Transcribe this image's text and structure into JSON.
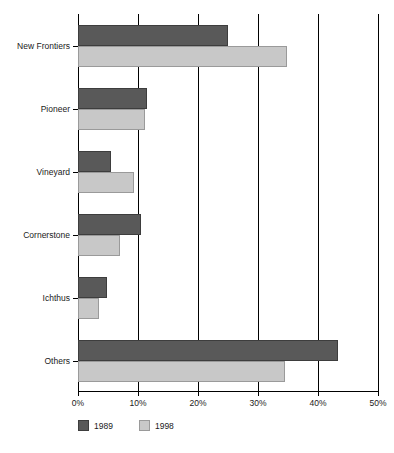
{
  "chart_data": {
    "type": "bar",
    "orientation": "horizontal",
    "title": "1989 and 1998",
    "xlabel": "",
    "ylabel": "",
    "categories": [
      "New Frontiers",
      "Pioneer",
      "Vineyard",
      "Cornerstone",
      "Ichthus",
      "Others"
    ],
    "series": [
      {
        "name": "1989",
        "color": "#595959",
        "values": [
          25.0,
          11.5,
          5.5,
          10.5,
          4.8,
          43.3
        ]
      },
      {
        "name": "1998",
        "color": "#c8c8c8",
        "values": [
          34.8,
          11.2,
          9.3,
          7.0,
          3.5,
          34.5
        ]
      }
    ],
    "xlim": [
      0,
      50
    ],
    "xticks": [
      0,
      10,
      20,
      30,
      40,
      50
    ],
    "xtick_labels": [
      "0%",
      "10%",
      "20%",
      "30%",
      "40%",
      "50%"
    ],
    "grid": true,
    "grid_axis": "x",
    "legend_position": "bottom-left",
    "value_unit": "percent"
  },
  "legend": {
    "items": [
      {
        "label": "1989",
        "swatch_class": "s-1989"
      },
      {
        "label": "1998",
        "swatch_class": "s-1998"
      }
    ]
  },
  "colors": {
    "series_1989": "#595959",
    "series_1998": "#c8c8c8",
    "axis": "#000000",
    "text": "#1a1a1a",
    "background": "#ffffff"
  }
}
